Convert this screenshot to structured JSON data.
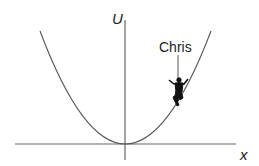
{
  "diagram": {
    "type": "potential-energy-curve",
    "axes": {
      "y_label": "U",
      "x_label": "x"
    },
    "curve": "parabola",
    "annotation": {
      "label": "Chris",
      "marker": "skateboarder-figure"
    },
    "colors": {
      "line": "#555555",
      "text": "#222222",
      "figure": "#111111",
      "background": "#ffffff"
    }
  }
}
